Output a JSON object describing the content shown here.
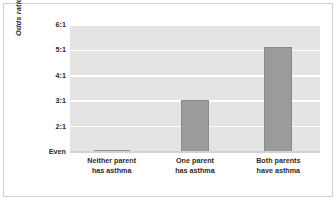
{
  "chart_data": {
    "type": "bar",
    "title": "",
    "subtitle": "",
    "xlabel": "",
    "ylabel": "Odds ratio",
    "categories": [
      "Neither parent has asthma",
      "One parent has asthma",
      "Both parents have asthma"
    ],
    "category_lines": [
      [
        "Neither parent",
        "has asthma"
      ],
      [
        "One parent",
        "has asthma"
      ],
      [
        "Both parents",
        "have asthma"
      ]
    ],
    "values": [
      1.0,
      3.05,
      5.15
    ],
    "value_labels": [
      "Even",
      "3:1",
      "5.1:1"
    ],
    "ylim": [
      1,
      6
    ],
    "yticks": [
      1,
      2,
      3,
      4,
      5,
      6
    ],
    "ytick_labels": [
      "Even",
      "2:1",
      "3:1",
      "4:1",
      "5:1",
      "6:1"
    ],
    "grid": true,
    "grid_axis": "y",
    "legend": false,
    "legend_position": "none",
    "bar_color": "#9b9b9b",
    "bar_edge_color": "#8a8a8a",
    "plot_background": "#e4e4e4",
    "gridline_color": "#ffffff",
    "text_color": "#2b2b2b",
    "frame_border_color": "#cfcfcf"
  }
}
